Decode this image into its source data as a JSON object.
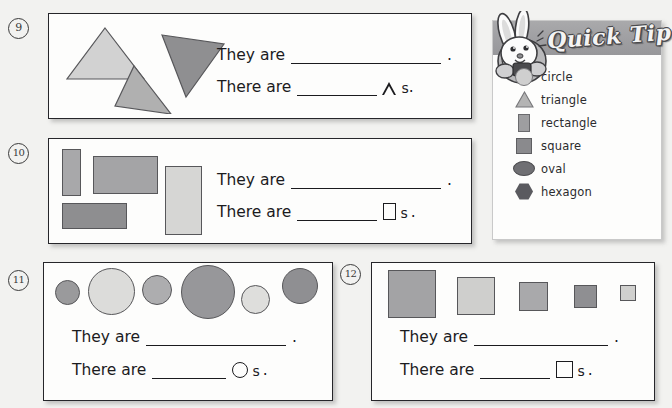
{
  "page": {
    "background": "#f2f2f0",
    "box_fill": "#fdfdfc"
  },
  "prompts": {
    "they_are": "They are",
    "there_are": "There are",
    "period": ".",
    "plural_suffix": "s",
    "plural_period": "."
  },
  "problems": [
    {
      "number": "9",
      "shape_type": "triangle",
      "glyph": "triangle-outline-glyph",
      "they_are": "They are",
      "there_are": "There are",
      "shapes": [
        {
          "name": "triangle-light",
          "fill": "#d2d2d2"
        },
        {
          "name": "triangle-medium",
          "fill": "#b0b0b0"
        },
        {
          "name": "triangle-dark",
          "fill": "#8f8f91"
        }
      ]
    },
    {
      "number": "10",
      "shape_type": "rectangle",
      "glyph": "rectangle-outline-glyph",
      "they_are": "They are",
      "there_are": "There are",
      "shapes": [
        {
          "name": "rectangle-narrow-vertical",
          "fill": "#a8a8aa"
        },
        {
          "name": "rectangle-wide-horizontal",
          "fill": "#a4a4a6"
        },
        {
          "name": "rectangle-tall-light",
          "fill": "#d6d6d4"
        },
        {
          "name": "rectangle-dark-horizontal",
          "fill": "#8e8e90"
        }
      ]
    },
    {
      "number": "11",
      "shape_type": "circle",
      "glyph": "circle-outline-glyph",
      "they_are": "They are",
      "there_are": "There are",
      "shapes": [
        {
          "name": "circle-small-dark",
          "fill": "#9a9a9c"
        },
        {
          "name": "circle-large-light",
          "fill": "#dcdcda"
        },
        {
          "name": "circle-medium-gray",
          "fill": "#adadaf"
        },
        {
          "name": "circle-xlarge-dark",
          "fill": "#97979a"
        },
        {
          "name": "circle-small-light",
          "fill": "#dededc"
        },
        {
          "name": "circle-medium-dark",
          "fill": "#8f8f92"
        }
      ]
    },
    {
      "number": "12",
      "shape_type": "square",
      "glyph": "square-outline-glyph",
      "they_are": "They are",
      "there_are": "There are",
      "shapes": [
        {
          "name": "square-xlarge",
          "fill": "#a3a3a5"
        },
        {
          "name": "square-large-light",
          "fill": "#cfcfcd"
        },
        {
          "name": "square-medium",
          "fill": "#a9a9ab"
        },
        {
          "name": "square-small",
          "fill": "#8f8f92"
        },
        {
          "name": "square-tiny",
          "fill": "#d0d0ce"
        }
      ]
    }
  ],
  "quick_tip": {
    "title": "Quick Tip",
    "mascot": "rabbit-mascot",
    "legend": [
      {
        "icon": "circle-icon",
        "label": "circle",
        "fill": "#cfcfcf"
      },
      {
        "icon": "triangle-icon",
        "label": "triangle",
        "fill": "#b4b4b4"
      },
      {
        "icon": "rectangle-icon",
        "label": "rectangle",
        "fill": "#9e9ea0"
      },
      {
        "icon": "square-icon",
        "label": "square",
        "fill": "#8a8a8d"
      },
      {
        "icon": "oval-icon",
        "label": "oval",
        "fill": "#6f6f73"
      },
      {
        "icon": "hexagon-icon",
        "label": "hexagon",
        "fill": "#5a5a5f"
      }
    ]
  }
}
